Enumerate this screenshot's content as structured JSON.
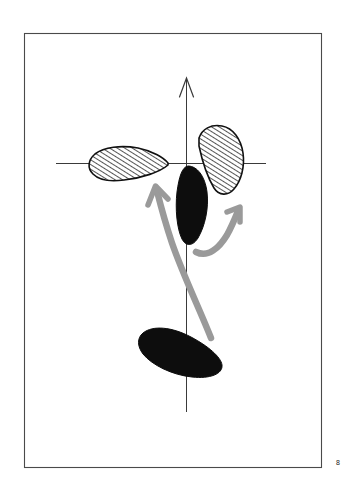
{
  "figure": {
    "page_number": "8",
    "frame": {
      "x": 24,
      "y": 33,
      "width": 298,
      "height": 435,
      "stroke": "#4a4a4a",
      "stroke_width": 1.1,
      "fill": "#ffffff"
    },
    "axes": {
      "stroke": "#3a3a3a",
      "stroke_width": 1.0,
      "vertical": {
        "name": "vertical-axis",
        "x": 186,
        "y_top": 80,
        "y_bottom": 412,
        "arrowhead": "open-v-up",
        "arrowhead_tip_x": 186,
        "arrowhead_tip_y": 78
      },
      "horizontal": {
        "name": "horizontal-axis",
        "y": 163,
        "x_left": 56,
        "x_right": 266,
        "arrowhead": "none"
      }
    },
    "lobes": [
      {
        "id": "left-hatched-lobe",
        "style": "hatched",
        "fill": "#ffffff",
        "stroke": "#111111",
        "hatch_color": "#222222",
        "hatch_angle_deg": 62,
        "hatch_spacing_px": 4,
        "centroid_x": 122,
        "centroid_y": 164
      },
      {
        "id": "upper-right-hatched-lobe",
        "style": "hatched",
        "fill": "#ffffff",
        "stroke": "#111111",
        "hatch_color": "#222222",
        "hatch_angle_deg": 62,
        "hatch_spacing_px": 4,
        "centroid_x": 222,
        "centroid_y": 156
      },
      {
        "id": "center-black-lobe",
        "style": "filled",
        "fill": "#0d0d0d",
        "stroke": "#0d0d0d",
        "centroid_x": 192,
        "centroid_y": 205
      },
      {
        "id": "bottom-black-lobe",
        "style": "filled",
        "fill": "#0d0d0d",
        "stroke": "#0d0d0d",
        "centroid_x": 176,
        "centroid_y": 352
      }
    ],
    "arrows": [
      {
        "id": "left-gray-arrow",
        "color": "#9a9a9a",
        "stroke_width": 6,
        "direction": "up-left",
        "tip_x": 155,
        "tip_y": 187,
        "tail_x": 208,
        "tail_y": 337
      },
      {
        "id": "right-gray-arrow",
        "color": "#9a9a9a",
        "stroke_width": 6,
        "direction": "up-right",
        "tip_x": 239,
        "tip_y": 209,
        "tail_x": 197,
        "tail_y": 252
      }
    ]
  }
}
